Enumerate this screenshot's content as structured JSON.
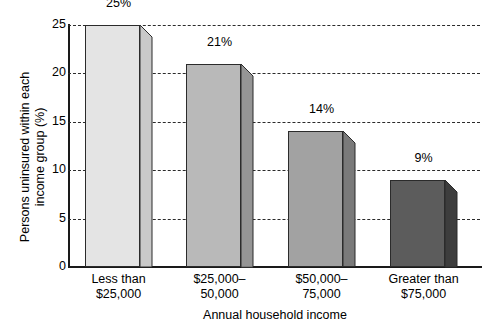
{
  "chart_data": {
    "type": "bar",
    "title": "",
    "xlabel": "Annual household income",
    "ylabel_line1": "Persons uninsured within each",
    "ylabel_line2": "income group (%)",
    "categories": [
      {
        "line1": "Less than",
        "line2": "$25,000"
      },
      {
        "line1": "$25,000–",
        "line2": "50,000"
      },
      {
        "line1": "$50,000–",
        "line2": "75,000"
      },
      {
        "line1": "Greater than",
        "line2": "$75,000"
      }
    ],
    "values": [
      25,
      21,
      14,
      9
    ],
    "value_labels": [
      "25%",
      "21%",
      "14%",
      "9%"
    ],
    "ylim": [
      0,
      25
    ],
    "yticks": [
      0,
      5,
      10,
      15,
      20,
      25
    ],
    "ytick_labels": [
      "0",
      "5",
      "10",
      "15",
      "20",
      "25"
    ],
    "grid": true,
    "grid_style": "dashed horizontal",
    "legend": "none",
    "bar_colors_front": [
      "#e4e4e4",
      "#b9b9b9",
      "#a2a2a2",
      "#5c5c5c"
    ],
    "bar_colors_side": [
      "#c9c9c9",
      "#959595",
      "#7a7a7a",
      "#3d3d3d"
    ],
    "style": "3d-extruded-bars",
    "axis_color": "#1a1a1a"
  }
}
